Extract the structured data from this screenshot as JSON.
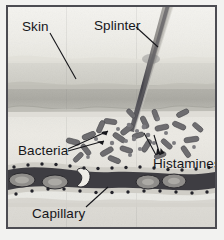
{
  "figure": {
    "kind": "anatomical-diagram",
    "style": "grayscale halftone illustration",
    "frame_color": "#4c4c52",
    "background_color": "#f2f2f0"
  },
  "labels": {
    "skin": "Skin",
    "splinter": "Splinter",
    "bacteria": "Bacteria",
    "histamines": "Histamines",
    "capillary": "Capillary"
  },
  "layers": [
    {
      "name": "epidermis-surface",
      "tone": "#f1f0eb"
    },
    {
      "name": "epidermis-band",
      "tone": "#d4d3cc"
    },
    {
      "name": "dermis-band",
      "tone": "#aca ba4"
    },
    {
      "name": "subcutaneous",
      "tone": "#e8e6e0"
    },
    {
      "name": "deep-tissue",
      "tone": "#dad8d2"
    }
  ],
  "splinter": {
    "name": "wood-splinter",
    "entry_point_x": 155,
    "tip_x": 128,
    "tip_y": 128,
    "shade_dark": "#57565a",
    "shade_light": "#b9b7b2"
  },
  "capillary": {
    "name": "blood-capillary",
    "wall_color": "#cfcdc6",
    "lumen_color": "#3e3d42",
    "red_blood_cells": 6,
    "endothelial_nuclei": 26
  },
  "particles": {
    "bacteria_count": 30,
    "bacteria_color": "#6e6d70",
    "histamine_count": 18,
    "histamine_color": "#7d7c80"
  },
  "leader_lines": {
    "color": "#1a1a1e",
    "skin": {
      "from": [
        47,
        29
      ],
      "to": [
        74,
        74
      ]
    },
    "splinter": {
      "from": [
        134,
        24
      ],
      "to": [
        155,
        43
      ]
    },
    "bacteria_a": {
      "from": [
        66,
        145
      ],
      "to": [
        104,
        128
      ]
    },
    "bacteria_b": {
      "from": [
        66,
        147
      ],
      "to": [
        100,
        138
      ]
    },
    "histamine_a": {
      "from": [
        152,
        152
      ],
      "to": [
        139,
        130
      ]
    },
    "histamine_b": {
      "from": [
        156,
        152
      ],
      "to": [
        149,
        132
      ]
    },
    "capillary": {
      "from": [
        82,
        204
      ],
      "to": [
        103,
        185
      ]
    }
  }
}
